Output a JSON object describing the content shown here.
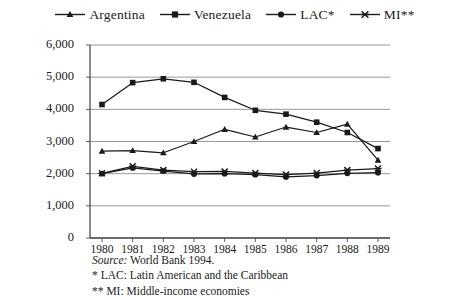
{
  "chart_data": {
    "type": "line",
    "title": "",
    "xlabel": "",
    "ylabel": "GDP per capita",
    "x": [
      "1980",
      "1981",
      "1982",
      "1983",
      "1984",
      "1985",
      "1986",
      "1987",
      "1988",
      "1989"
    ],
    "ylim": [
      0,
      6000
    ],
    "ytick_labels": [
      "0",
      "1,000",
      "2,000",
      "3,000",
      "4,000",
      "5,000",
      "6,000"
    ],
    "ytick_values": [
      0,
      1000,
      2000,
      3000,
      4000,
      5000,
      6000
    ],
    "grid": true,
    "legend_position": "top-center",
    "series": [
      {
        "name": "Argentina",
        "marker": "triangle",
        "values": [
          2700,
          2720,
          2650,
          3000,
          3380,
          3140,
          3450,
          3280,
          3540,
          2420
        ]
      },
      {
        "name": "Venezuela",
        "marker": "square",
        "values": [
          4150,
          4830,
          4950,
          4840,
          4370,
          3970,
          3850,
          3600,
          3280,
          2780
        ]
      },
      {
        "name": "LAC*",
        "marker": "circle",
        "values": [
          2000,
          2180,
          2080,
          1990,
          2000,
          1970,
          1900,
          1940,
          2010,
          2030
        ]
      },
      {
        "name": "MI**",
        "marker": "star",
        "values": [
          2010,
          2230,
          2110,
          2060,
          2070,
          2020,
          1970,
          2020,
          2110,
          2160
        ]
      }
    ]
  },
  "legend": {
    "items": [
      {
        "label": "Argentina",
        "key": "argentina-key"
      },
      {
        "label": "Venezuela",
        "key": "venezuela-key"
      },
      {
        "label": "LAC*",
        "key": "lac-key"
      },
      {
        "label": "MI**",
        "key": "mi-key"
      }
    ]
  },
  "axes": {
    "y_title": "GDP per capita",
    "y_ticks": [
      "6,000",
      "5,000",
      "4,000",
      "3,000",
      "2,000",
      "1,000",
      "0"
    ],
    "x_ticks": [
      "1980",
      "1981",
      "1982",
      "1983",
      "1984",
      "1985",
      "1986",
      "1987",
      "1988",
      "1989"
    ]
  },
  "notes": {
    "source_label": "Source:",
    "source_text": "World Bank 1994.",
    "footnote1": "* LAC: Latin American and the Caribbean",
    "footnote2": "** MI: Middle-income economies"
  },
  "colors": {
    "ink": "#1a1a1a",
    "grid": "#8c8c8c",
    "axis": "#4d4d4d",
    "background": "#ffffff"
  }
}
